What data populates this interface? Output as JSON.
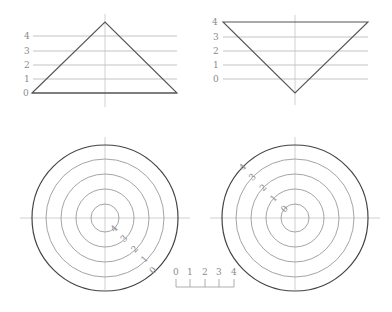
{
  "diagram": {
    "colors": {
      "grid": "#b4b4b4",
      "outline": "#555555",
      "label": "#8a8a8a"
    },
    "profile_peak": {
      "levels": [
        "0",
        "1",
        "2",
        "3",
        "4"
      ]
    },
    "profile_depression": {
      "levels": [
        "0",
        "1",
        "2",
        "3",
        "4"
      ]
    },
    "contour_peak": {
      "labels": [
        "0",
        "1",
        "2",
        "3",
        "4"
      ]
    },
    "contour_depression": {
      "labels": [
        "0",
        "1",
        "2",
        "3",
        "4"
      ]
    },
    "scale_bar": {
      "ticks": [
        "0",
        "1",
        "2",
        "3",
        "4"
      ]
    }
  }
}
